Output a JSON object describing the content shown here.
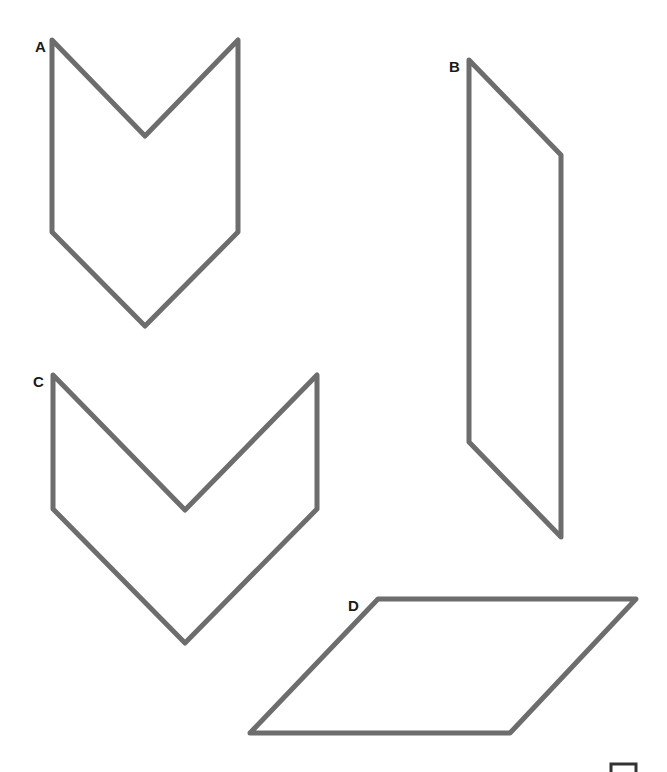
{
  "figure": {
    "stroke_color": "#6d6d6d",
    "label_color": "#1a1a1a",
    "shapes": [
      {
        "label": "A",
        "kind": "chevron",
        "points": "52,40 145,136 238,40 238,232 145,326 52,232",
        "label_pos": [
          35,
          52
        ]
      },
      {
        "label": "B",
        "kind": "parallelogram",
        "points": "469,60 561,155 561,537 469,442",
        "label_pos": [
          449,
          72
        ]
      },
      {
        "label": "C",
        "kind": "chevron",
        "points": "53,375 185,510 317,375 317,509 185,643 53,509",
        "label_pos": [
          33,
          387
        ]
      },
      {
        "label": "D",
        "kind": "parallelogram",
        "points": "378,599 636,599 510,733 250,733",
        "label_pos": [
          348,
          611
        ]
      }
    ],
    "corner_mark": {
      "points": "611,772 611,764 636,764 636,772"
    }
  }
}
